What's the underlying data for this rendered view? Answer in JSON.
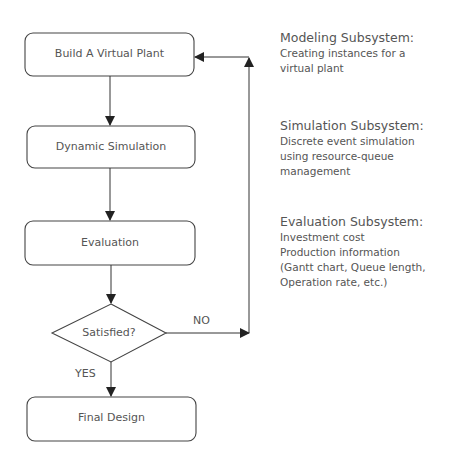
{
  "flowchart": {
    "nodes": [
      {
        "id": "build",
        "label": "Build A Virtual Plant",
        "shape": "rounded-rect"
      },
      {
        "id": "simulate",
        "label": "Dynamic Simulation",
        "shape": "rounded-rect"
      },
      {
        "id": "evaluate",
        "label": "Evaluation",
        "shape": "rounded-rect"
      },
      {
        "id": "decision",
        "label": "Satisfied?",
        "shape": "diamond"
      },
      {
        "id": "final",
        "label": "Final Design",
        "shape": "rounded-rect"
      }
    ],
    "edges": [
      {
        "from": "build",
        "to": "simulate",
        "label": ""
      },
      {
        "from": "simulate",
        "to": "evaluate",
        "label": ""
      },
      {
        "from": "evaluate",
        "to": "decision",
        "label": ""
      },
      {
        "from": "decision",
        "to": "final",
        "label": "YES"
      },
      {
        "from": "decision",
        "to": "build",
        "label": "NO"
      }
    ]
  },
  "subsystems": [
    {
      "title": "Modeling Subsystem:",
      "lines": [
        "Creating instances for a",
        "virtual plant"
      ]
    },
    {
      "title": "Simulation Subsystem:",
      "lines": [
        "Discrete event simulation",
        "using resource-queue",
        "management"
      ]
    },
    {
      "title": "Evaluation Subsystem:",
      "lines": [
        "Investment cost",
        "Production information",
        "(Gantt chart, Queue length,",
        "Operation rate,  etc.)"
      ]
    }
  ],
  "colors": {
    "stroke": "#333333",
    "text": "#555555",
    "background": "#ffffff"
  }
}
